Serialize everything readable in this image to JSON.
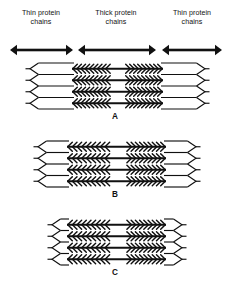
{
  "figure": {
    "background_color": "#ffffff",
    "ink_color": "#111111",
    "width": 230,
    "height": 291,
    "labels": [
      {
        "id": "thin-left",
        "text": "Thin protein\nchains",
        "cx": 41,
        "cy": 18
      },
      {
        "id": "thick-mid",
        "text": "Thick protein\nchains",
        "cx": 116,
        "cy": 18
      },
      {
        "id": "thin-right",
        "text": "Thin protein\nchains",
        "cx": 192,
        "cy": 18
      }
    ],
    "span_arrows": [
      {
        "id": "thin-left-span",
        "x1": 10,
        "x2": 73,
        "y": 50
      },
      {
        "id": "thick-mid-span",
        "x1": 78,
        "x2": 156,
        "y": 50
      },
      {
        "id": "thin-right-span",
        "x1": 162,
        "x2": 222,
        "y": 50
      }
    ],
    "panels": [
      {
        "id": "A",
        "letter": "A",
        "state": "relaxed",
        "letter_cx": 115,
        "letter_cy": 112,
        "left": 30,
        "right": 205,
        "top": 63,
        "row_count": 4,
        "row_height": 11.5,
        "thick_left": 72,
        "thick_right": 163,
        "bare_zone_left": 110,
        "bare_zone_right": 126,
        "head_count_per_half": 9
      },
      {
        "id": "B",
        "letter": "B",
        "state": "partially contracted",
        "letter_cx": 115,
        "letter_cy": 190,
        "left": 38,
        "right": 196,
        "top": 141,
        "row_count": 4,
        "row_height": 11.5,
        "thick_left": 67,
        "thick_right": 166,
        "bare_zone_left": 110,
        "bare_zone_right": 127,
        "head_count_per_half": 9
      },
      {
        "id": "C",
        "letter": "C",
        "state": "fully contracted",
        "letter_cx": 115,
        "letter_cy": 268,
        "left": 52,
        "right": 182,
        "top": 219,
        "row_count": 4,
        "row_height": 11.5,
        "thick_left": 67,
        "thick_right": 166,
        "bare_zone_left": 110,
        "bare_zone_right": 127,
        "head_count_per_half": 9
      }
    ]
  }
}
